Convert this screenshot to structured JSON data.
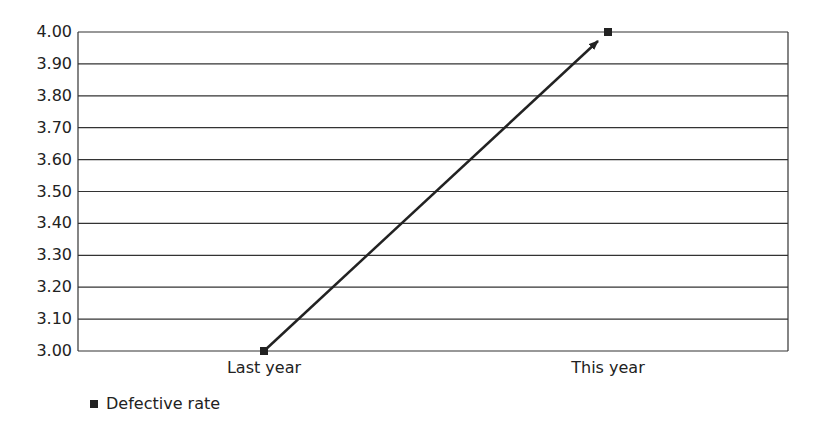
{
  "chart_data": {
    "type": "line",
    "title": "",
    "xlabel": "",
    "ylabel": "",
    "categories": [
      "Last year",
      "This year"
    ],
    "series": [
      {
        "name": "Defective rate",
        "values": [
          3.0,
          4.0
        ]
      }
    ],
    "ylim": [
      3.0,
      4.0
    ],
    "yticks": [
      "4.00",
      "3.90",
      "3.80",
      "3.70",
      "3.60",
      "3.50",
      "3.40",
      "3.30",
      "3.20",
      "3.10",
      "3.00"
    ],
    "grid": true,
    "legend_position": "bottom-left",
    "annotations": [
      "arrow from Last year to This year"
    ]
  },
  "legend": {
    "label": "Defective rate"
  },
  "colors": {
    "line": "#222222",
    "grid": "#333333"
  }
}
